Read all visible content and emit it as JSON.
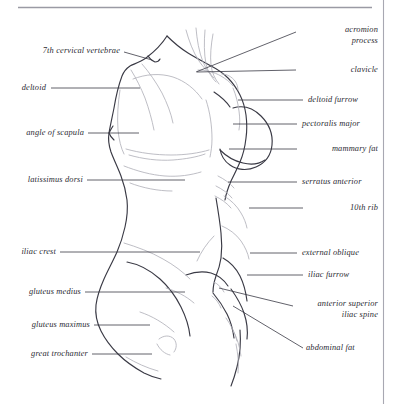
{
  "page": {
    "background_color": "#ffffff",
    "ink_color": "#2b2b33",
    "line_color": "#3a3a45",
    "faint_line_color": "#b9b9c2",
    "rule_color": "#9a9aa4",
    "border_color": "#a8a8b2"
  },
  "rules": {
    "top_rule": "horizontal rule near top of page",
    "right_border": "vertical page border line at right margin"
  },
  "labels_left": [
    {
      "id": "seventh-cervical-vertebrae",
      "text": "7th cervical vertebrae",
      "lines": [
        "7th cervical vertebrae"
      ]
    },
    {
      "id": "deltoid",
      "text": "deltoid",
      "lines": [
        "deltoid"
      ]
    },
    {
      "id": "angle-of-scapula",
      "text": "angle of scapula",
      "lines": [
        "angle of scapula"
      ]
    },
    {
      "id": "latissimus-dorsi",
      "text": "latissimus dorsi",
      "lines": [
        "latissimus dorsi"
      ]
    },
    {
      "id": "iliac-crest",
      "text": "iliac crest",
      "lines": [
        "iliac crest"
      ]
    },
    {
      "id": "gluteus-medius",
      "text": "gluteus medius",
      "lines": [
        "gluteus medius"
      ]
    },
    {
      "id": "gluteus-maximus",
      "text": "gluteus maximus",
      "lines": [
        "gluteus maximus"
      ]
    },
    {
      "id": "great-trochanter",
      "text": "great trochanter",
      "lines": [
        "great trochanter"
      ]
    }
  ],
  "labels_right": [
    {
      "id": "acromion-process",
      "text": "acromion process",
      "line1": "acromion",
      "line2": "process"
    },
    {
      "id": "clavicle",
      "text": "clavicle",
      "line1": "clavicle",
      "line2": ""
    },
    {
      "id": "deltoid-furrow",
      "text": "deltoid furrow",
      "line1": "deltoid furrow",
      "line2": ""
    },
    {
      "id": "pectoralis-major",
      "text": "pectoralis major",
      "line1": "pectoralis major",
      "line2": ""
    },
    {
      "id": "mammary-fat",
      "text": "mammary fat",
      "line1": "mammary fat",
      "line2": ""
    },
    {
      "id": "serratus-anterior",
      "text": "serratus anterior",
      "line1": "serratus anterior",
      "line2": ""
    },
    {
      "id": "tenth-rib",
      "text": "10th rib",
      "line1": "10th rib",
      "line2": ""
    },
    {
      "id": "external-oblique",
      "text": "external oblique",
      "line1": "external oblique",
      "line2": ""
    },
    {
      "id": "iliac-furrow",
      "text": "iliac furrow",
      "line1": "iliac furrow",
      "line2": ""
    },
    {
      "id": "anterior-superior-iliac-spine",
      "text": "anterior superior iliac spine",
      "line1": "anterior superior",
      "line2": "iliac spine"
    },
    {
      "id": "abdominal-fat",
      "text": "abdominal fat",
      "line1": "abdominal fat",
      "line2": ""
    }
  ],
  "label_text": {
    "l0": "7th cervical vertebrae",
    "l1": "deltoid",
    "l2": "angle of scapula",
    "l3": "latissimus dorsi",
    "l4": "iliac crest",
    "l5": "gluteus medius",
    "l6": "gluteus maximus",
    "l7": "great trochanter",
    "r0a": "acromion",
    "r0b": "process",
    "r1": "clavicle",
    "r2": "deltoid furrow",
    "r3": "pectoralis major",
    "r4": "mammary fat",
    "r5": "serratus anterior",
    "r6": "10th rib",
    "r7": "external oblique",
    "r8": "iliac furrow",
    "r9a": "anterior superior",
    "r9b": "iliac spine",
    "r10": "abdominal fat"
  }
}
